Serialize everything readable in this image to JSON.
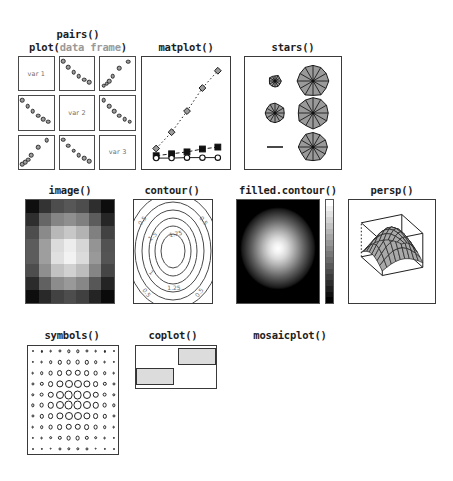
{
  "figure": {
    "background": "#ffffff",
    "accent_gray": "#a8a8a8",
    "line_color": "#2e2e2e"
  },
  "captions": {
    "pairs": "pairs()",
    "plot_prefix": "plot(",
    "plot_dim": "data frame",
    "plot_suffix": ")",
    "matplot": "matplot()",
    "stars": "stars()",
    "image": "image()",
    "contour": "contour()",
    "filled_contour": "filled.contour()",
    "persp": "persp()",
    "symbols": "symbols()",
    "coplot": "coplot()",
    "mosaicplot": "mosaicplot()"
  },
  "pairs": {
    "diagonal_labels": [
      "var 1",
      "var 2",
      "var 3"
    ],
    "cells": [
      {
        "row": 0,
        "col": 0,
        "kind": "label",
        "label": "var 1"
      },
      {
        "row": 0,
        "col": 1,
        "kind": "scatter",
        "trend": "down"
      },
      {
        "row": 0,
        "col": 2,
        "kind": "scatter",
        "trend": "up"
      },
      {
        "row": 1,
        "col": 0,
        "kind": "scatter",
        "trend": "down"
      },
      {
        "row": 1,
        "col": 1,
        "kind": "label",
        "label": "var 2"
      },
      {
        "row": 1,
        "col": 2,
        "kind": "scatter",
        "trend": "down"
      },
      {
        "row": 2,
        "col": 0,
        "kind": "scatter",
        "trend": "up"
      },
      {
        "row": 2,
        "col": 1,
        "kind": "scatter",
        "trend": "down"
      },
      {
        "row": 2,
        "col": 2,
        "kind": "label",
        "label": "var 3"
      }
    ]
  },
  "chart_data": [
    {
      "type": "scatter",
      "name": "pairs-scatter-down",
      "title": "pairs() off-diagonal decreasing",
      "x": [
        0.1,
        0.25,
        0.4,
        0.55,
        0.7,
        0.85
      ],
      "y": [
        0.88,
        0.7,
        0.55,
        0.42,
        0.32,
        0.24
      ],
      "xlabel": "",
      "ylabel": "",
      "grid": false
    },
    {
      "type": "scatter",
      "name": "pairs-scatter-up",
      "title": "pairs() off-diagonal increasing",
      "x": [
        0.1,
        0.18,
        0.26,
        0.36,
        0.55,
        0.8
      ],
      "y": [
        0.14,
        0.2,
        0.28,
        0.42,
        0.66,
        0.86
      ],
      "xlabel": "",
      "ylabel": "",
      "grid": false
    },
    {
      "type": "line",
      "name": "matplot",
      "title": "matplot()",
      "x": [
        1,
        2,
        3,
        4,
        5
      ],
      "series": [
        {
          "name": "series-1-diamond",
          "marker": "diamond",
          "line": "dotted",
          "values": [
            0.13,
            0.3,
            0.52,
            0.76,
            0.94
          ]
        },
        {
          "name": "series-2-filled-square",
          "marker": "filled-square",
          "line": "dashed",
          "values": [
            0.055,
            0.075,
            0.095,
            0.125,
            0.145
          ]
        },
        {
          "name": "series-3-open-circle",
          "marker": "open-circle",
          "line": "solid",
          "values": [
            0.03,
            0.03,
            0.035,
            0.035,
            0.035
          ]
        }
      ],
      "xlim": [
        0.6,
        5.4
      ],
      "ylim": [
        0,
        1
      ],
      "grid": false,
      "legend": "none"
    },
    {
      "type": "heatmap",
      "name": "image",
      "title": "image()",
      "colormap": "grayscale",
      "ncols": 7,
      "nrows": 8,
      "values": [
        [
          0.06,
          0.2,
          0.3,
          0.34,
          0.3,
          0.18,
          0.05
        ],
        [
          0.18,
          0.4,
          0.52,
          0.56,
          0.5,
          0.36,
          0.15
        ],
        [
          0.3,
          0.54,
          0.72,
          0.78,
          0.7,
          0.5,
          0.26
        ],
        [
          0.36,
          0.62,
          0.86,
          0.93,
          0.84,
          0.58,
          0.32
        ],
        [
          0.36,
          0.62,
          0.88,
          0.95,
          0.86,
          0.6,
          0.33
        ],
        [
          0.3,
          0.56,
          0.76,
          0.82,
          0.74,
          0.52,
          0.27
        ],
        [
          0.17,
          0.38,
          0.55,
          0.6,
          0.53,
          0.34,
          0.14
        ],
        [
          0.05,
          0.16,
          0.26,
          0.3,
          0.25,
          0.14,
          0.04
        ]
      ]
    },
    {
      "type": "contour",
      "name": "contour",
      "title": "contour()",
      "levels": [
        0.5,
        1,
        1.25,
        1.5,
        1.75
      ],
      "labels": [
        "0.5",
        "1",
        "1.25",
        "1.5",
        "1.75"
      ],
      "grid": false
    },
    {
      "type": "heatmap",
      "name": "filled-contour",
      "title": "filled.contour()",
      "colormap": "grayscale",
      "colorbar": true,
      "colorbar_steps": 18,
      "description": "radial gradient, bright center to black edges"
    },
    {
      "type": "surface",
      "name": "persp",
      "title": "persp()",
      "mesh_rows": 9,
      "mesh_cols": 8,
      "description": "3D perspective mesh dome with bounding box"
    },
    {
      "type": "scatter",
      "name": "symbols",
      "title": "symbols()",
      "grid_rows": 10,
      "grid_cols": 10,
      "radius_scale": "bivariate-normal, max at center",
      "max_radius_px": 4.6,
      "min_radius_px": 0.6
    },
    {
      "type": "scatter",
      "name": "coplot",
      "title": "coplot()",
      "shingle_bars": [
        {
          "x0": 0.52,
          "x1": 1.0,
          "y0": 0.55,
          "y1": 0.95
        },
        {
          "x0": 0.0,
          "x1": 0.48,
          "y0": 0.08,
          "y1": 0.48
        }
      ],
      "panels": [
        {
          "name": "panel-left",
          "x": [
            0.08,
            0.16,
            0.24,
            0.34,
            0.46,
            0.64
          ],
          "y": [
            0.1,
            0.16,
            0.24,
            0.4,
            0.58,
            0.84
          ]
        },
        {
          "name": "panel-right",
          "x": [
            0.18,
            0.36,
            0.52,
            0.7,
            0.84,
            0.92
          ],
          "y": [
            0.84,
            0.6,
            0.4,
            0.24,
            0.16,
            0.1
          ]
        }
      ],
      "grid": true,
      "gridlines": 8
    },
    {
      "type": "bar",
      "name": "mosaicplot",
      "title": "mosaicplot()",
      "columns": [
        {
          "name": "col-1",
          "tiles": [
            {
              "h": 0.44
            },
            {
              "h": 0.28
            },
            {
              "h": 0.13
            }
          ]
        },
        {
          "name": "col-2",
          "tiles": [
            {
              "h": 0.3
            },
            {
              "h": 0.29
            },
            {
              "h": 0.29
            }
          ]
        },
        {
          "name": "col-3",
          "tiles": [
            {
              "h": 0.16
            },
            {
              "h": 0.27
            },
            {
              "h": 0.45
            }
          ]
        }
      ],
      "fill": "#a8a8a8"
    },
    {
      "type": "pie",
      "name": "stars",
      "title": "stars()",
      "rows": 3,
      "cols": 2,
      "glyphs": [
        {
          "name": "glyph-1",
          "segments": 12,
          "scale": 0.4,
          "style": "partial"
        },
        {
          "name": "glyph-2",
          "segments": 12,
          "scale": 1.0,
          "style": "full"
        },
        {
          "name": "glyph-3",
          "segments": 12,
          "scale": 0.62,
          "style": "full"
        },
        {
          "name": "glyph-4",
          "segments": 12,
          "scale": 1.0,
          "style": "full"
        },
        {
          "name": "glyph-5",
          "segments": 0,
          "scale": 0.05,
          "style": "dash"
        },
        {
          "name": "glyph-6",
          "segments": 12,
          "scale": 0.92,
          "style": "full"
        }
      ]
    }
  ]
}
